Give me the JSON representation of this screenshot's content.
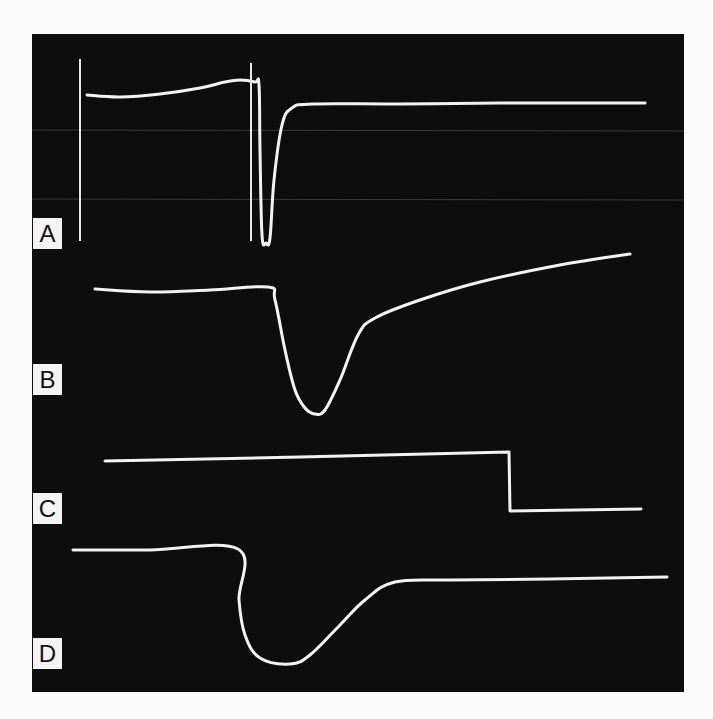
{
  "figure": {
    "background": "#fbfbfb",
    "panel_color": "#0d0d0d",
    "trace_color": "#f2f2f2",
    "grid_color": "#3a3a3a",
    "panels": [
      {
        "label": "A"
      },
      {
        "label": "B"
      },
      {
        "label": "C"
      },
      {
        "label": "D"
      }
    ]
  },
  "chart_data": {
    "type": "line",
    "title": "",
    "xlabel": "",
    "ylabel": "",
    "grid": false,
    "legend": "none",
    "note": "Oscilloscope-style traces; no axis ticks or numeric scale shown. Coordinates are pixel positions within the image (x right, y down).",
    "series": [
      {
        "name": "A",
        "markers_x": [
          80,
          251
        ],
        "points": [
          [
            87,
            95
          ],
          [
            120,
            97
          ],
          [
            160,
            94
          ],
          [
            200,
            88
          ],
          [
            225,
            82
          ],
          [
            240,
            80
          ],
          [
            255,
            82
          ],
          [
            259,
            85
          ],
          [
            260,
            150
          ],
          [
            262,
            235
          ],
          [
            266,
            243
          ],
          [
            270,
            238
          ],
          [
            274,
            180
          ],
          [
            282,
            125
          ],
          [
            292,
            108
          ],
          [
            313,
            104
          ],
          [
            400,
            104
          ],
          [
            500,
            103
          ],
          [
            645,
            103
          ]
        ]
      },
      {
        "name": "B",
        "points": [
          [
            95,
            289
          ],
          [
            150,
            292
          ],
          [
            210,
            290
          ],
          [
            268,
            287
          ],
          [
            275,
            300
          ],
          [
            285,
            350
          ],
          [
            295,
            390
          ],
          [
            305,
            408
          ],
          [
            315,
            414
          ],
          [
            325,
            410
          ],
          [
            340,
            380
          ],
          [
            358,
            335
          ],
          [
            375,
            318
          ],
          [
            420,
            300
          ],
          [
            480,
            282
          ],
          [
            560,
            265
          ],
          [
            630,
            254
          ]
        ]
      },
      {
        "name": "C",
        "points": [
          [
            105,
            461
          ],
          [
            300,
            457
          ],
          [
            509,
            452
          ],
          [
            510,
            511
          ],
          [
            641,
            509
          ]
        ]
      },
      {
        "name": "D",
        "points": [
          [
            73,
            550
          ],
          [
            150,
            550
          ],
          [
            238,
            549
          ],
          [
            239,
            600
          ],
          [
            245,
            635
          ],
          [
            260,
            658
          ],
          [
            290,
            664
          ],
          [
            310,
            655
          ],
          [
            340,
            625
          ],
          [
            365,
            600
          ],
          [
            395,
            582
          ],
          [
            450,
            580
          ],
          [
            550,
            579
          ],
          [
            667,
            577
          ]
        ]
      }
    ]
  }
}
